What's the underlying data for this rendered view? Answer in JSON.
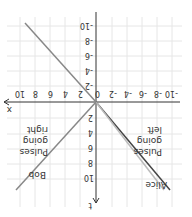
{
  "diagram": {
    "orientation": "rotated-180",
    "axes": {
      "x_label": "x",
      "t_label": "t",
      "x_ticks": [
        "-10",
        "-8",
        "-6",
        "-4",
        "-2",
        "0",
        "2",
        "4",
        "6",
        "8",
        "10"
      ],
      "t_ticks": [
        "-10",
        "-8",
        "-6",
        "-4",
        "-2",
        "2",
        "4",
        "6",
        "8",
        "10"
      ]
    },
    "lines": [
      {
        "name": "Alice",
        "color": "#444444"
      },
      {
        "name": "Pulses going left",
        "color": "#bbbbbb"
      },
      {
        "name": "Bob",
        "color": "#888888"
      },
      {
        "name": "upper line",
        "color": "#888888"
      }
    ],
    "labels": {
      "alice": "Alice",
      "bob": "Bob",
      "pulses_left": [
        "Pulses",
        "going",
        "left"
      ],
      "pulses_right": [
        "Pulses",
        "going",
        "right"
      ]
    },
    "colors": {
      "grid": "#e6e6e6",
      "axis": "#333333"
    }
  }
}
